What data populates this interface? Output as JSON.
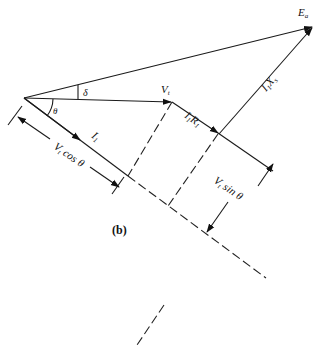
{
  "diagram": {
    "type": "phasor-diagram",
    "caption": "(b)",
    "labels": {
      "ea": {
        "main": "E",
        "sub": "a"
      },
      "vt": {
        "main": "V",
        "sub": "t"
      },
      "ia": {
        "main": "I",
        "sub": "1"
      },
      "iara": {
        "main1": "I",
        "sub1": "1",
        "main2": "R",
        "sub2": "1"
      },
      "iaxs": {
        "main1": "I",
        "sub1": "1",
        "main2": "X",
        "sub2": "s"
      },
      "theta": "θ",
      "delta": "δ",
      "vcos": {
        "main": "V",
        "sub": "t",
        "rest": " cos θ"
      },
      "vsin": {
        "main": "V",
        "sub": "t",
        "rest": " sin θ"
      }
    },
    "phasors": [
      {
        "name": "E_a",
        "from": [
          24,
          98
        ],
        "to": [
          313,
          27
        ]
      },
      {
        "name": "V_t",
        "from": [
          24,
          98
        ],
        "to": [
          172,
          102
        ]
      },
      {
        "name": "I_1",
        "from": [
          24,
          98
        ],
        "to": [
          80,
          140
        ]
      },
      {
        "name": "I_1R_1",
        "from": [
          172,
          102
        ],
        "to": [
          219,
          134
        ]
      },
      {
        "name": "I_1X_s",
        "from": [
          219,
          134
        ],
        "to": [
          313,
          27
        ]
      }
    ],
    "angles": [
      "theta",
      "delta"
    ]
  }
}
